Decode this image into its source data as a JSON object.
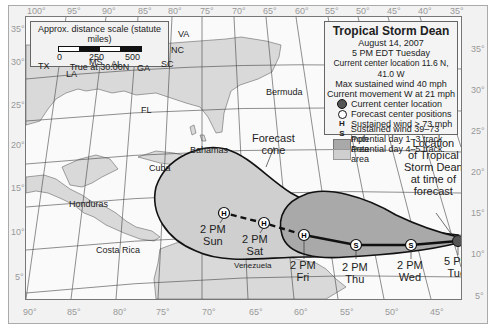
{
  "title": "Tropical Storm Dean",
  "legend": {
    "title": "Tropical Storm Dean",
    "date": "August 14, 2007",
    "time": "5 PM EDT Tuesday",
    "location": "Current center location 11.6 N, 41.0 W",
    "max_wind": "Max sustained wind 40 mph",
    "movement": "Current movement W at 21 mph",
    "items": [
      {
        "symbol": "filled-circle",
        "label": "Current center location"
      },
      {
        "symbol": "open-circle",
        "label": "Forecast center positions"
      },
      {
        "symbol": "H",
        "label": "Sustained wind > 73 mph"
      },
      {
        "symbol": "S",
        "label": "Sustained wind 39–73 mph"
      },
      {
        "symbol": "dark-swatch",
        "label": "Potential day 1–3 track area"
      },
      {
        "symbol": "light-swatch",
        "label": "Potential day 4–5 track area"
      }
    ]
  },
  "scale": {
    "title": "Approx. distance scale (statute miles)",
    "ticks": [
      "0",
      "250",
      "500"
    ],
    "note": "True at 30.00N"
  },
  "axes": {
    "top_lon": [
      "100°",
      "95°",
      "90°",
      "85°",
      "80°",
      "75°",
      "70°",
      "65°",
      "60°",
      "55°",
      "50°",
      "45°",
      "40°",
      "35°"
    ],
    "bottom_lon": [
      "90°",
      "85°",
      "80°",
      "75°",
      "70°",
      "65°",
      "60°",
      "55°",
      "50°",
      "45°"
    ],
    "left_lat": [
      "35°",
      "30°",
      "25°",
      "20°",
      "15°",
      "10°",
      "5°"
    ],
    "right_lat": [
      "35°",
      "30°",
      "25°",
      "20°",
      "15°",
      "10°",
      "5°"
    ]
  },
  "places": {
    "TX": "TX",
    "LA": "LA",
    "MS": "MS",
    "AL": "AL",
    "GA": "GA",
    "SC": "SC",
    "NC": "NC",
    "VA": "VA",
    "FL": "FL",
    "Bermuda": "Bermuda",
    "Bahamas": "Bahamas",
    "Cuba": "Cuba",
    "Honduras": "Honduras",
    "Costa_Rica": "Costa Rica",
    "Venezuela": "Venezuela"
  },
  "annotations": {
    "cone": [
      "Forecast",
      "cone"
    ],
    "location": [
      "Location",
      "of Tropical",
      "Storm Dean",
      "at time of",
      "forecast"
    ]
  },
  "track": [
    {
      "time": [
        "5 PM",
        "Tue"
      ],
      "symbol": "current"
    },
    {
      "time": [
        "2 PM",
        "Wed"
      ],
      "symbol": "S"
    },
    {
      "time": [
        "2 PM",
        "Thu"
      ],
      "symbol": "S"
    },
    {
      "time": [
        "2 PM",
        "Fri"
      ],
      "symbol": "H"
    },
    {
      "time": [
        "2 PM",
        "Sat"
      ],
      "symbol": "H"
    },
    {
      "time": [
        "2 PM",
        "Sun"
      ],
      "symbol": "H"
    }
  ],
  "colors": {
    "land": "#d9d9d9",
    "cone_day1_3": "#a9a9a9",
    "cone_day4_5": "#cfcfcf",
    "ocean": "#fafafa"
  }
}
